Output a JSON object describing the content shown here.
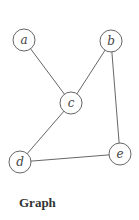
{
  "caption": "Graph",
  "colors": {
    "stroke": "#555555",
    "label": "#444444",
    "caption": "#333333",
    "background": "#ffffff"
  },
  "nodes": [
    {
      "id": "a",
      "label": "a",
      "x": 24,
      "y": 40
    },
    {
      "id": "b",
      "label": "b",
      "x": 111,
      "y": 41
    },
    {
      "id": "c",
      "label": "c",
      "x": 71,
      "y": 103
    },
    {
      "id": "d",
      "label": "d",
      "x": 20,
      "y": 162
    },
    {
      "id": "e",
      "label": "e",
      "x": 120,
      "y": 154
    }
  ],
  "node_radius": 11,
  "edges": [
    {
      "from": "a",
      "to": "c"
    },
    {
      "from": "b",
      "to": "c"
    },
    {
      "from": "c",
      "to": "d"
    },
    {
      "from": "d",
      "to": "e"
    },
    {
      "from": "b",
      "to": "e"
    }
  ]
}
